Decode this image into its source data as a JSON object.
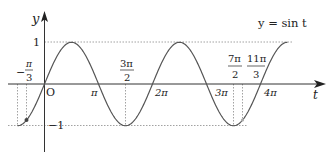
{
  "chart_data": {
    "type": "line",
    "title": "y = sin t",
    "xlabel": "t",
    "ylabel": "y",
    "function": "sin",
    "x_range": [
      "-π/2",
      "9π/2"
    ],
    "x_range_numeric": [
      -1.5708,
      14.1372
    ],
    "ylim": [
      -1,
      1
    ],
    "grid": false,
    "legend": "none",
    "origin_label": "O",
    "x_ticks": [
      {
        "value": 3.1416,
        "label": "π"
      },
      {
        "value": 6.2832,
        "label": "2π"
      },
      {
        "value": 9.4248,
        "label": "3π"
      },
      {
        "value": 12.5664,
        "label": "4π"
      }
    ],
    "x_fraction_labels": [
      {
        "value": -1.0472,
        "num": "π",
        "den": "3",
        "sign": "−"
      },
      {
        "value": 4.7124,
        "num": "3π",
        "den": "2",
        "sign": ""
      },
      {
        "value": 10.9956,
        "num": "7π",
        "den": "2",
        "sign": ""
      },
      {
        "value": 11.5192,
        "num": "11π",
        "den": "3",
        "sign": ""
      }
    ],
    "y_ticks": [
      {
        "value": 1,
        "label": "1"
      },
      {
        "value": -1,
        "label": "−1"
      }
    ],
    "marked_points": [
      {
        "t": -1.0472,
        "y": -0.866,
        "label": "(−π/3, −√3/2)"
      },
      {
        "t": 11.5192,
        "y": -0.866,
        "label": "(11π/3, −√3/2)"
      }
    ],
    "reference_lines": {
      "horizontal": [
        1,
        -1
      ],
      "vertical": [
        "-π/2",
        "-π/3",
        "3π/2",
        "7π/2",
        "11π/3"
      ]
    }
  },
  "labels": {
    "title": "y = sin t",
    "y_axis": "y",
    "x_axis": "t",
    "origin": "O",
    "one": "1",
    "minus_one": "−1",
    "pi": "π",
    "two_pi": "2π",
    "three_pi": "3π",
    "four_pi": "4π",
    "neg_sign": "−",
    "frac_pi3_num": "π",
    "frac_pi3_den": "3",
    "frac_3pi2_num": "3π",
    "frac_3pi2_den": "2",
    "frac_7pi2_num": "7π",
    "frac_7pi2_den": "2",
    "frac_11pi3_num": "11π",
    "frac_11pi3_den": "3"
  },
  "colors": {
    "curve": "#555555",
    "axis": "#333333",
    "dotted": "#888888"
  }
}
